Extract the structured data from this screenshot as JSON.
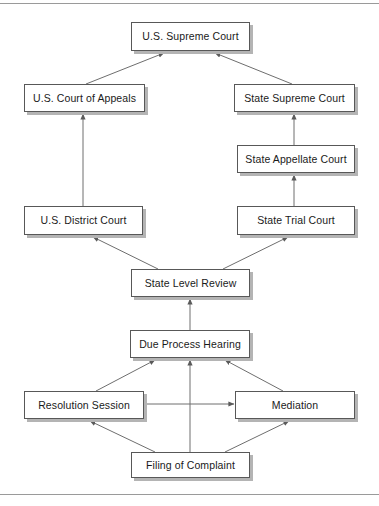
{
  "diagram": {
    "type": "flowchart",
    "frame": {
      "top_rule": "horizontal-rule",
      "bottom_rule": "horizontal-rule"
    },
    "nodes": [
      {
        "id": "us-supreme-court",
        "label": "U.S. Supreme Court",
        "x": 131,
        "y": 22,
        "w": 119,
        "h": 29
      },
      {
        "id": "us-court-of-appeals",
        "label": "U.S. Court of Appeals",
        "x": 24,
        "y": 84,
        "w": 121,
        "h": 28
      },
      {
        "id": "state-supreme-court",
        "label": "State Supreme Court",
        "x": 234,
        "y": 84,
        "w": 121,
        "h": 28
      },
      {
        "id": "state-appellate-court",
        "label": "State Appellate Court",
        "x": 237,
        "y": 145,
        "w": 118,
        "h": 28
      },
      {
        "id": "us-district-court",
        "label": "U.S. District Court",
        "x": 24,
        "y": 206,
        "w": 119,
        "h": 29
      },
      {
        "id": "state-trial-court",
        "label": "State Trial Court",
        "x": 237,
        "y": 206,
        "w": 118,
        "h": 29
      },
      {
        "id": "state-level-review",
        "label": "State Level Review",
        "x": 131,
        "y": 269,
        "w": 119,
        "h": 28
      },
      {
        "id": "due-process-hearing",
        "label": "Due Process Hearing",
        "x": 130,
        "y": 330,
        "w": 120,
        "h": 28
      },
      {
        "id": "resolution-session",
        "label": "Resolution Session",
        "x": 24,
        "y": 391,
        "w": 120,
        "h": 28
      },
      {
        "id": "mediation",
        "label": "Mediation",
        "x": 235,
        "y": 391,
        "w": 120,
        "h": 28
      },
      {
        "id": "filing-of-complaint",
        "label": "Filing of Complaint",
        "x": 131,
        "y": 452,
        "w": 119,
        "h": 26
      }
    ],
    "edges": [
      {
        "from": "us-court-of-appeals",
        "to": "us-supreme-court",
        "style": "diagonal-arrow"
      },
      {
        "from": "state-supreme-court",
        "to": "us-supreme-court",
        "style": "diagonal-arrow"
      },
      {
        "from": "us-district-court",
        "to": "us-court-of-appeals",
        "style": "vertical-arrow"
      },
      {
        "from": "state-appellate-court",
        "to": "state-supreme-court",
        "style": "vertical-arrow"
      },
      {
        "from": "state-trial-court",
        "to": "state-appellate-court",
        "style": "vertical-arrow"
      },
      {
        "from": "state-level-review",
        "to": "us-district-court",
        "style": "diagonal-arrow"
      },
      {
        "from": "state-level-review",
        "to": "state-trial-court",
        "style": "diagonal-arrow"
      },
      {
        "from": "due-process-hearing",
        "to": "state-level-review",
        "style": "vertical-arrow"
      },
      {
        "from": "resolution-session",
        "to": "due-process-hearing",
        "style": "diagonal-arrow"
      },
      {
        "from": "mediation",
        "to": "due-process-hearing",
        "style": "diagonal-arrow"
      },
      {
        "from": "filing-of-complaint",
        "to": "due-process-hearing",
        "style": "vertical-arrow"
      },
      {
        "from": "filing-of-complaint",
        "to": "resolution-session",
        "style": "diagonal-arrow"
      },
      {
        "from": "filing-of-complaint",
        "to": "mediation",
        "style": "diagonal-arrow"
      },
      {
        "from": "resolution-session",
        "to": "mediation",
        "style": "horizontal-arrow"
      }
    ],
    "colors": {
      "node_fill": "#ffffff",
      "node_border": "#585858",
      "node_shadow": "#b4b4b4",
      "edge": "#6e6e6e",
      "text": "#1a1a1a",
      "frame_rule": "#9a9a9a",
      "background": "#ffffff"
    }
  }
}
